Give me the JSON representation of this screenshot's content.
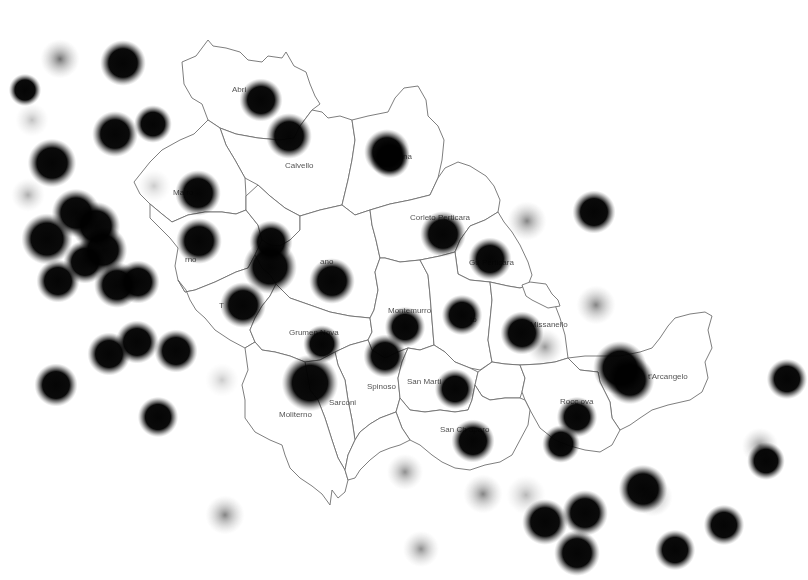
{
  "map": {
    "type": "heatmap-overlay",
    "background": "#ffffff",
    "boundary_color": "#6f6f6f",
    "point_color": "#0a0a0a",
    "municipalities": [
      {
        "name": "Abriola",
        "label": "Abri",
        "x": 232,
        "y": 92
      },
      {
        "name": "Calvello",
        "label": "Calvello",
        "x": 285,
        "y": 168
      },
      {
        "name": "Laurenzana",
        "label": "na",
        "x": 403,
        "y": 159
      },
      {
        "name": "Marsicovetere",
        "label": "Ma         ro",
        "x": 173,
        "y": 195
      },
      {
        "name": "Corleto Perticara",
        "label": "Corleto Perticara",
        "x": 410,
        "y": 220
      },
      {
        "name": "Guardia Perticara",
        "label": "Gu      Perticara",
        "x": 469,
        "y": 265
      },
      {
        "name": "Marsico Nuovo",
        "label": "     rno",
        "x": 185,
        "y": 262
      },
      {
        "name": "Viggiano",
        "label": "      ano",
        "x": 320,
        "y": 264
      },
      {
        "name": "Tramutola",
        "label": "T",
        "x": 219,
        "y": 308
      },
      {
        "name": "Grumento Nova",
        "label": "Grumen    Nova",
        "x": 289,
        "y": 335
      },
      {
        "name": "Montemurro",
        "label": "Montemurro",
        "x": 388,
        "y": 313
      },
      {
        "name": "Armento",
        "label": "     to",
        "x": 470,
        "y": 322
      },
      {
        "name": "Gallicchio",
        "label": "    llo",
        "x": 540,
        "y": 325
      },
      {
        "name": "Missanello",
        "label": "Missanello",
        "x": 530,
        "y": 327
      },
      {
        "name": "Spinoso",
        "label": "Spinoso",
        "x": 367,
        "y": 389
      },
      {
        "name": "San Martino d'Agri",
        "label": "San Marti         ",
        "x": 407,
        "y": 384
      },
      {
        "name": "Sant'Arcangelo",
        "label": "t'Arcangelo",
        "x": 648,
        "y": 379
      },
      {
        "name": "Roccanova",
        "label": "Rocc   ova",
        "x": 560,
        "y": 404
      },
      {
        "name": "Sarconi",
        "label": "Sarconi",
        "x": 329,
        "y": 405
      },
      {
        "name": "Moliterno",
        "label": "Moliterno",
        "x": 279,
        "y": 417
      },
      {
        "name": "San Chirico Raparo",
        "label": "San Ch      aparo",
        "x": 440,
        "y": 432
      }
    ],
    "points": [
      {
        "x": 60,
        "y": 59,
        "r": 14,
        "intensity": 0.7
      },
      {
        "x": 123,
        "y": 63,
        "r": 17,
        "intensity": 1.0
      },
      {
        "x": 25,
        "y": 90,
        "r": 12,
        "intensity": 1.0
      },
      {
        "x": 115,
        "y": 134,
        "r": 17,
        "intensity": 1.0
      },
      {
        "x": 153,
        "y": 124,
        "r": 14,
        "intensity": 0.85
      },
      {
        "x": 52,
        "y": 163,
        "r": 18,
        "intensity": 1.0
      },
      {
        "x": 32,
        "y": 120,
        "r": 12,
        "intensity": 0.3
      },
      {
        "x": 261,
        "y": 100,
        "r": 16,
        "intensity": 1.0
      },
      {
        "x": 289,
        "y": 136,
        "r": 17,
        "intensity": 1.0
      },
      {
        "x": 387,
        "y": 152,
        "r": 17,
        "intensity": 1.0
      },
      {
        "x": 390,
        "y": 158,
        "r": 15,
        "intensity": 0.9
      },
      {
        "x": 198,
        "y": 193,
        "r": 17,
        "intensity": 1.0
      },
      {
        "x": 154,
        "y": 186,
        "r": 12,
        "intensity": 0.2
      },
      {
        "x": 443,
        "y": 234,
        "r": 17,
        "intensity": 1.0
      },
      {
        "x": 490,
        "y": 259,
        "r": 16,
        "intensity": 0.9
      },
      {
        "x": 527,
        "y": 221,
        "r": 14,
        "intensity": 0.6
      },
      {
        "x": 594,
        "y": 212,
        "r": 16,
        "intensity": 1.0
      },
      {
        "x": 199,
        "y": 241,
        "r": 17,
        "intensity": 1.0
      },
      {
        "x": 271,
        "y": 242,
        "r": 16,
        "intensity": 1.0
      },
      {
        "x": 270,
        "y": 267,
        "r": 20,
        "intensity": 1.0
      },
      {
        "x": 243,
        "y": 305,
        "r": 17,
        "intensity": 1.0
      },
      {
        "x": 332,
        "y": 281,
        "r": 17,
        "intensity": 1.0
      },
      {
        "x": 322,
        "y": 344,
        "r": 14,
        "intensity": 1.0
      },
      {
        "x": 310,
        "y": 383,
        "r": 21,
        "intensity": 1.0
      },
      {
        "x": 405,
        "y": 327,
        "r": 15,
        "intensity": 1.0
      },
      {
        "x": 385,
        "y": 356,
        "r": 16,
        "intensity": 1.0
      },
      {
        "x": 462,
        "y": 315,
        "r": 15,
        "intensity": 1.0
      },
      {
        "x": 455,
        "y": 389,
        "r": 15,
        "intensity": 0.9
      },
      {
        "x": 522,
        "y": 333,
        "r": 16,
        "intensity": 1.0
      },
      {
        "x": 545,
        "y": 347,
        "r": 13,
        "intensity": 0.5
      },
      {
        "x": 596,
        "y": 305,
        "r": 14,
        "intensity": 0.6
      },
      {
        "x": 620,
        "y": 368,
        "r": 20,
        "intensity": 1.0
      },
      {
        "x": 630,
        "y": 380,
        "r": 18,
        "intensity": 1.0
      },
      {
        "x": 577,
        "y": 417,
        "r": 15,
        "intensity": 1.0
      },
      {
        "x": 561,
        "y": 444,
        "r": 14,
        "intensity": 0.95
      },
      {
        "x": 473,
        "y": 441,
        "r": 16,
        "intensity": 1.0
      },
      {
        "x": 787,
        "y": 379,
        "r": 15,
        "intensity": 1.0
      },
      {
        "x": 760,
        "y": 446,
        "r": 13,
        "intensity": 0.55
      },
      {
        "x": 766,
        "y": 461,
        "r": 14,
        "intensity": 0.9
      },
      {
        "x": 643,
        "y": 489,
        "r": 18,
        "intensity": 1.0
      },
      {
        "x": 653,
        "y": 497,
        "r": 14,
        "intensity": 0.6
      },
      {
        "x": 724,
        "y": 525,
        "r": 15,
        "intensity": 1.0
      },
      {
        "x": 585,
        "y": 513,
        "r": 17,
        "intensity": 1.0
      },
      {
        "x": 545,
        "y": 522,
        "r": 17,
        "intensity": 1.0
      },
      {
        "x": 526,
        "y": 495,
        "r": 14,
        "intensity": 0.35
      },
      {
        "x": 483,
        "y": 494,
        "r": 14,
        "intensity": 0.6
      },
      {
        "x": 405,
        "y": 472,
        "r": 13,
        "intensity": 0.55
      },
      {
        "x": 577,
        "y": 553,
        "r": 17,
        "intensity": 1.0
      },
      {
        "x": 675,
        "y": 550,
        "r": 15,
        "intensity": 1.0
      },
      {
        "x": 421,
        "y": 549,
        "r": 13,
        "intensity": 0.55
      },
      {
        "x": 158,
        "y": 417,
        "r": 15,
        "intensity": 1.0
      },
      {
        "x": 225,
        "y": 515,
        "r": 14,
        "intensity": 0.6
      },
      {
        "x": 222,
        "y": 380,
        "r": 12,
        "intensity": 0.25
      },
      {
        "x": 56,
        "y": 385,
        "r": 16,
        "intensity": 1.0
      },
      {
        "x": 109,
        "y": 354,
        "r": 16,
        "intensity": 1.0
      },
      {
        "x": 137,
        "y": 342,
        "r": 16,
        "intensity": 1.0
      },
      {
        "x": 176,
        "y": 351,
        "r": 16,
        "intensity": 1.0
      },
      {
        "x": 58,
        "y": 281,
        "r": 16,
        "intensity": 1.0
      },
      {
        "x": 47,
        "y": 239,
        "r": 19,
        "intensity": 1.0
      },
      {
        "x": 76,
        "y": 213,
        "r": 18,
        "intensity": 1.0
      },
      {
        "x": 96,
        "y": 226,
        "r": 18,
        "intensity": 1.0
      },
      {
        "x": 103,
        "y": 250,
        "r": 18,
        "intensity": 1.0
      },
      {
        "x": 85,
        "y": 262,
        "r": 16,
        "intensity": 1.0
      },
      {
        "x": 117,
        "y": 285,
        "r": 17,
        "intensity": 1.0
      },
      {
        "x": 138,
        "y": 282,
        "r": 16,
        "intensity": 1.0
      },
      {
        "x": 28,
        "y": 195,
        "r": 12,
        "intensity": 0.4
      }
    ]
  }
}
